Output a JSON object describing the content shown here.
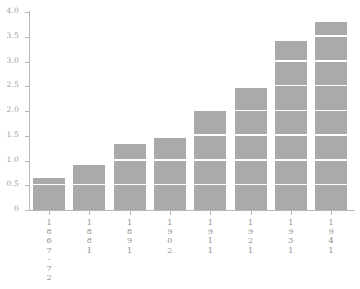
{
  "chart_data": {
    "type": "bar",
    "title": "",
    "subtitle": "",
    "xlabel": "",
    "ylabel": "",
    "categories": [
      "1867-72",
      "1881",
      "1891",
      "1902",
      "1911",
      "1921",
      "1931",
      "1941"
    ],
    "values": [
      0.65,
      0.91,
      1.33,
      1.45,
      2.02,
      2.46,
      3.42,
      3.8
    ],
    "ylim": [
      0,
      4.0
    ],
    "ytick_labels": [
      "0",
      "0.5",
      "1.0",
      "1.5",
      "2.0",
      "2.5",
      "3.0",
      "3.5",
      "4.0"
    ],
    "ytick_values": [
      0,
      0.5,
      1.0,
      1.5,
      2.0,
      2.5,
      3.0,
      3.5,
      4.0
    ],
    "grid": "white horizontal gridlines drawn over bars at each 0.5 interval",
    "legend": null,
    "legend_position": "none",
    "bar_color": "#aaaaaa",
    "gridline_color": "#ffffff",
    "axis_color": "#b9b9b9",
    "tick_label_color": "#9a9a9a",
    "background_color": "#ffffff"
  }
}
